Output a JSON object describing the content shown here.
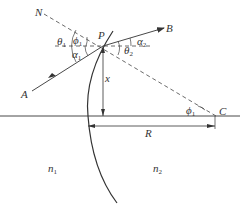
{
  "diagram": {
    "type": "refraction at spherical surface",
    "points": {
      "N": "N",
      "P": "P",
      "A": "A",
      "B": "B",
      "C": "C"
    },
    "angles": {
      "theta1": {
        "sym": "θ",
        "sub": "1"
      },
      "phi1_top": {
        "sym": "ϕ",
        "sub": "1"
      },
      "alpha1": {
        "sym": "α",
        "sub": "1"
      },
      "alpha2": {
        "sym": "α",
        "sub": "2"
      },
      "theta2": {
        "sym": "θ",
        "sub": "2"
      },
      "phi1_c": {
        "sym": "ϕ",
        "sub": "1"
      }
    },
    "dimensions": {
      "x": "x",
      "R": "R"
    },
    "media": {
      "n1": {
        "sym": "n",
        "sub": "1"
      },
      "n2": {
        "sym": "n",
        "sub": "2"
      }
    },
    "colors": {
      "line": "#333333",
      "background": "#ffffff"
    }
  }
}
